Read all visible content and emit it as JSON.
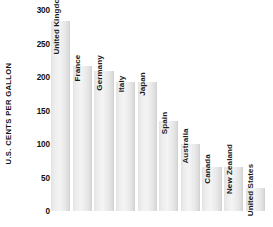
{
  "chart_data": {
    "type": "bar",
    "title": "",
    "xlabel": "",
    "ylabel": "U.S. CENTS PER GALLON",
    "ylim": [
      0,
      300
    ],
    "ytick_labels": [
      "300",
      "250",
      "200",
      "150",
      "100",
      "50",
      "0"
    ],
    "ytick_values": [
      300,
      250,
      200,
      150,
      100,
      50,
      0
    ],
    "grid": false,
    "legend": "none",
    "categories": [
      "United Kingdom",
      "France",
      "Germany",
      "Italy",
      "Japan",
      "Spain",
      "Australia",
      "Canada",
      "New Zealand",
      "United States"
    ],
    "values": [
      283,
      216,
      209,
      193,
      193,
      135,
      100,
      65,
      65,
      35
    ],
    "bar_color": "#ededed",
    "bar_edge_color": "#d2d2d2",
    "background_color": "#ffffff",
    "text_color": "#1a1a1a",
    "label_orientation": "vertical"
  }
}
